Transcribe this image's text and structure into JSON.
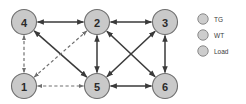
{
  "chart_data": {
    "type": "diagram",
    "title": "",
    "subtitle": "",
    "xlabel": "",
    "ylabel": "",
    "grid": false,
    "legend_position": "right",
    "diagram_kind": "directed-graph",
    "nodes": [
      {
        "id": "1",
        "label": "1",
        "x": 24,
        "y": 86,
        "r": 12.5,
        "fill": "#c9c9c9",
        "stroke": "#6e6e6e"
      },
      {
        "id": "2",
        "label": "2",
        "x": 97,
        "y": 22,
        "r": 12.5,
        "fill": "#c9c9c9",
        "stroke": "#6e6e6e"
      },
      {
        "id": "3",
        "label": "3",
        "x": 165,
        "y": 22,
        "r": 12.5,
        "fill": "#c9c9c9",
        "stroke": "#6e6e6e"
      },
      {
        "id": "4",
        "label": "4",
        "x": 24,
        "y": 22,
        "r": 12.5,
        "fill": "#c9c9c9",
        "stroke": "#6e6e6e"
      },
      {
        "id": "5",
        "label": "5",
        "x": 97,
        "y": 86,
        "r": 12.5,
        "fill": "#c9c9c9",
        "stroke": "#6e6e6e"
      },
      {
        "id": "6",
        "label": "6",
        "x": 165,
        "y": 86,
        "r": 12.5,
        "fill": "#c9c9c9",
        "stroke": "#6e6e6e"
      }
    ],
    "edges": [
      {
        "from": "4",
        "to": "2",
        "style": "solid",
        "arrows": "both"
      },
      {
        "from": "2",
        "to": "3",
        "style": "solid",
        "arrows": "both"
      },
      {
        "from": "4",
        "to": "5",
        "style": "solid",
        "arrows": "both"
      },
      {
        "from": "2",
        "to": "5",
        "style": "solid",
        "arrows": "both"
      },
      {
        "from": "2",
        "to": "6",
        "style": "solid",
        "arrows": "both"
      },
      {
        "from": "3",
        "to": "5",
        "style": "solid",
        "arrows": "both"
      },
      {
        "from": "3",
        "to": "6",
        "style": "solid",
        "arrows": "both"
      },
      {
        "from": "5",
        "to": "6",
        "style": "solid",
        "arrows": "both"
      },
      {
        "from": "4",
        "to": "1",
        "style": "dashed",
        "arrows": "both"
      },
      {
        "from": "1",
        "to": "2",
        "style": "dashed",
        "arrows": "both"
      },
      {
        "from": "1",
        "to": "5",
        "style": "dashed",
        "arrows": "both"
      }
    ],
    "legend": [
      {
        "key": "TG",
        "label": "TG",
        "marker": "circle",
        "color": "#cdcdcd",
        "x": 203,
        "y": 19
      },
      {
        "key": "WT",
        "label": "WT",
        "marker": "circle",
        "color": "#cdcdcd",
        "x": 203,
        "y": 35
      },
      {
        "key": "Load",
        "label": "Load",
        "marker": "circle",
        "color": "#cdcdcd",
        "x": 203,
        "y": 51
      }
    ],
    "colors": {
      "node_fill": "#c9c9c9",
      "node_stroke": "#6e6e6e",
      "solid_edge": "#3a3a3a",
      "dashed_edge": "#707070",
      "background": "#ffffff"
    }
  }
}
